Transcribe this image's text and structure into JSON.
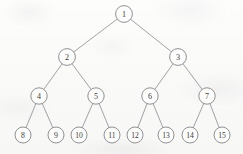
{
  "diagram": {
    "type": "binary-tree",
    "node_radius": 8.2,
    "leaf_radius": 8.0,
    "colors": {
      "background": "#fbfbfa",
      "edge_stroke": "#8b8b90",
      "node_stroke": "#7e7e84",
      "node_fill": "#fdfdfc",
      "label_text": "#3a3a3d"
    },
    "nodes": [
      {
        "id": "n1",
        "label": "1",
        "cx": 124,
        "cy": 14,
        "r": 8.4,
        "level": 0,
        "font_size": 8.2
      },
      {
        "id": "n2",
        "label": "2",
        "cx": 67,
        "cy": 57,
        "r": 8.4,
        "level": 1,
        "font_size": 8.2
      },
      {
        "id": "n3",
        "label": "3",
        "cx": 178,
        "cy": 57,
        "r": 8.4,
        "level": 1,
        "font_size": 8.2
      },
      {
        "id": "n4",
        "label": "4",
        "cx": 39,
        "cy": 96,
        "r": 8.2,
        "level": 2,
        "font_size": 8.0
      },
      {
        "id": "n5",
        "label": "5",
        "cx": 96,
        "cy": 96,
        "r": 8.2,
        "level": 2,
        "font_size": 8.0
      },
      {
        "id": "n6",
        "label": "6",
        "cx": 150,
        "cy": 96,
        "r": 8.2,
        "level": 2,
        "font_size": 8.0
      },
      {
        "id": "n7",
        "label": "7",
        "cx": 207,
        "cy": 96,
        "r": 8.2,
        "level": 2,
        "font_size": 8.0
      },
      {
        "id": "n8",
        "label": "8",
        "cx": 23,
        "cy": 135,
        "r": 8.0,
        "level": 3,
        "font_size": 7.8
      },
      {
        "id": "n9",
        "label": "9",
        "cx": 56,
        "cy": 135,
        "r": 8.0,
        "level": 3,
        "font_size": 7.8
      },
      {
        "id": "n10",
        "label": "10",
        "cx": 79,
        "cy": 135,
        "r": 8.0,
        "level": 3,
        "font_size": 7.6
      },
      {
        "id": "n11",
        "label": "11",
        "cx": 112,
        "cy": 135,
        "r": 8.0,
        "level": 3,
        "font_size": 7.6
      },
      {
        "id": "n12",
        "label": "12",
        "cx": 135,
        "cy": 135,
        "r": 8.0,
        "level": 3,
        "font_size": 7.6
      },
      {
        "id": "n13",
        "label": "13",
        "cx": 166,
        "cy": 135,
        "r": 8.0,
        "level": 3,
        "font_size": 7.6
      },
      {
        "id": "n14",
        "label": "14",
        "cx": 190,
        "cy": 135,
        "r": 8.0,
        "level": 3,
        "font_size": 7.6
      },
      {
        "id": "n15",
        "label": "15",
        "cx": 222,
        "cy": 135,
        "r": 8.0,
        "level": 3,
        "font_size": 7.6
      }
    ],
    "edges": [
      {
        "id": "e1-2",
        "from": "n1",
        "to": "n2"
      },
      {
        "id": "e1-3",
        "from": "n1",
        "to": "n3"
      },
      {
        "id": "e2-4",
        "from": "n2",
        "to": "n4"
      },
      {
        "id": "e2-5",
        "from": "n2",
        "to": "n5"
      },
      {
        "id": "e3-6",
        "from": "n3",
        "to": "n6"
      },
      {
        "id": "e3-7",
        "from": "n3",
        "to": "n7"
      },
      {
        "id": "e4-8",
        "from": "n4",
        "to": "n8"
      },
      {
        "id": "e4-9",
        "from": "n4",
        "to": "n9"
      },
      {
        "id": "e5-10",
        "from": "n5",
        "to": "n10"
      },
      {
        "id": "e5-11",
        "from": "n5",
        "to": "n11"
      },
      {
        "id": "e6-12",
        "from": "n6",
        "to": "n12"
      },
      {
        "id": "e6-13",
        "from": "n6",
        "to": "n13"
      },
      {
        "id": "e7-14",
        "from": "n7",
        "to": "n14"
      },
      {
        "id": "e7-15",
        "from": "n7",
        "to": "n15"
      }
    ]
  }
}
